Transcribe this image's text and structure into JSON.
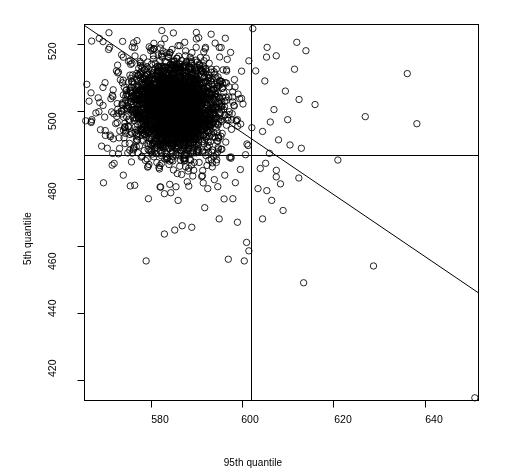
{
  "figure": {
    "type": "scatter-plot",
    "background_color": "#ffffff",
    "foreground_color": "#000000"
  },
  "axes": {
    "x_title": "95th quantile",
    "y_title": "5th quantile",
    "x_ticks": [
      580,
      600,
      620,
      640
    ],
    "y_ticks": [
      420,
      440,
      460,
      480,
      500,
      520
    ]
  },
  "chart_data": {
    "type": "scatter",
    "title": "",
    "xlabel": "95th quantile",
    "ylabel": "5th quantile",
    "xlim": [
      565.5,
      651.8
    ],
    "ylim": [
      414.0,
      525.8
    ],
    "xticks": [
      580,
      600,
      620,
      640
    ],
    "yticks": [
      420,
      440,
      460,
      480,
      500,
      520
    ],
    "grid": false,
    "legend": null,
    "marker": "open-circle",
    "marker_size_px": 4.2,
    "n_points_total": 3000,
    "cluster": {
      "description": "dense elliptical overplotted cloud of bivariate points",
      "center_x": 585.5,
      "center_y": 501.0,
      "sd_x": 4.6,
      "sd_y": 6.4,
      "correlation": -0.06,
      "n_points": 2900
    },
    "annotations": [
      {
        "kind": "vline",
        "label": "95th quantile threshold",
        "x": 602.0
      },
      {
        "kind": "hline",
        "label": "5th quantile threshold",
        "y": 487.0
      },
      {
        "kind": "line",
        "label": "fitted line",
        "x0": 565.5,
        "y0": 525.5,
        "x1": 651.8,
        "y1": 446.0
      }
    ],
    "outlier_points": [
      [
        636.2,
        511.2
      ],
      [
        627.0,
        498.4
      ],
      [
        638.3,
        496.3
      ],
      [
        651.0,
        414.8
      ],
      [
        628.8,
        454.0
      ],
      [
        613.5,
        449.0
      ],
      [
        621.0,
        485.5
      ],
      [
        614.0,
        518.0
      ],
      [
        611.5,
        512.5
      ],
      [
        607.5,
        516.5
      ],
      [
        605.0,
        509.0
      ],
      [
        609.5,
        506.0
      ],
      [
        612.5,
        503.5
      ],
      [
        616.0,
        502.0
      ],
      [
        607.0,
        500.5
      ],
      [
        610.0,
        497.5
      ],
      [
        604.5,
        494.0
      ],
      [
        608.0,
        491.5
      ],
      [
        613.0,
        489.0
      ],
      [
        606.0,
        487.5
      ],
      [
        604.0,
        483.0
      ],
      [
        607.5,
        480.5
      ],
      [
        603.5,
        477.0
      ],
      [
        606.5,
        473.5
      ],
      [
        609.0,
        470.5
      ],
      [
        604.5,
        468.0
      ],
      [
        598.0,
        474.0
      ],
      [
        592.5,
        477.0
      ],
      [
        586.0,
        473.5
      ],
      [
        583.0,
        475.5
      ],
      [
        579.5,
        474.0
      ],
      [
        576.5,
        478.0
      ],
      [
        574.0,
        481.0
      ],
      [
        572.0,
        484.5
      ],
      [
        570.5,
        489.0
      ],
      [
        569.0,
        494.5
      ],
      [
        568.0,
        499.5
      ],
      [
        568.5,
        504.0
      ],
      [
        570.0,
        508.5
      ],
      [
        572.5,
        512.0
      ],
      [
        575.5,
        515.0
      ],
      [
        580.0,
        518.0
      ],
      [
        586.0,
        519.5
      ],
      [
        592.0,
        519.0
      ],
      [
        597.5,
        517.5
      ],
      [
        601.5,
        515.0
      ],
      [
        583.0,
        463.5
      ],
      [
        579.0,
        455.5
      ],
      [
        597.0,
        456.0
      ],
      [
        601.0,
        461.0
      ],
      [
        601.5,
        458.5
      ],
      [
        600.5,
        455.5
      ],
      [
        589.0,
        465.5
      ],
      [
        595.0,
        468.0
      ],
      [
        566.5,
        503.0
      ],
      [
        567.0,
        497.0
      ],
      [
        566.0,
        508.0
      ],
      [
        571.0,
        519.0
      ],
      [
        577.0,
        521.0
      ],
      [
        590.0,
        521.5
      ],
      [
        603.0,
        512.0
      ],
      [
        605.5,
        519.0
      ],
      [
        612.0,
        520.5
      ],
      [
        599.0,
        467.0
      ]
    ]
  }
}
